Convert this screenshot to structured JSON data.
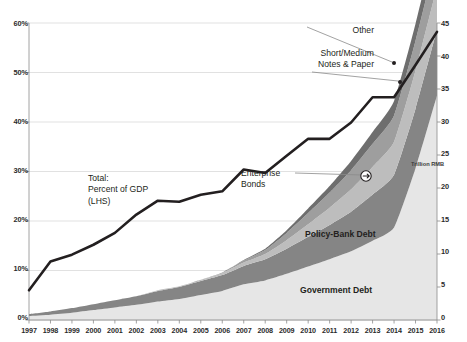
{
  "chart_data": {
    "type": "area",
    "title": "",
    "subtitle": "",
    "xlabel": "",
    "ylabel": "",
    "ylabel_right": "Trillion RMB",
    "grid": true,
    "legend_position": "in-plot annotations",
    "x": [
      1997,
      1998,
      1999,
      2000,
      2001,
      2002,
      2003,
      2004,
      2005,
      2006,
      2007,
      2008,
      2009,
      2010,
      2011,
      2012,
      2013,
      2014,
      2015,
      2016
    ],
    "xtick_labels": [
      "1997",
      "1998",
      "1999",
      "2000",
      "2001",
      "2002",
      "2003",
      "2004",
      "2005",
      "2006",
      "2007",
      "2008",
      "2009",
      "2010",
      "2011",
      "2012",
      "2013",
      "2014",
      "2015",
      "2016"
    ],
    "left_axis": {
      "ticks": [
        0,
        10,
        20,
        30,
        40,
        50,
        60
      ],
      "tick_labels": [
        "0%",
        "10%",
        "20%",
        "30%",
        "40%",
        "50%",
        "60%"
      ],
      "ylim": [
        0,
        60
      ],
      "unit": "percent of GDP"
    },
    "right_axis": {
      "ticks": [
        0,
        5,
        10,
        15,
        20,
        25,
        30,
        35,
        40,
        45
      ],
      "tick_labels": [
        "0",
        "5",
        "10",
        "15",
        "20",
        "25",
        "30",
        "35",
        "40",
        "45"
      ],
      "ylim": [
        0,
        45
      ],
      "unit": "Trillion RMB"
    },
    "line_series": {
      "name": "Total: Percent of GDP (LHS)",
      "axis": "left",
      "color": "#231f20",
      "values": [
        6.0,
        11.8,
        13.2,
        15.2,
        17.6,
        21.3,
        24.1,
        23.9,
        25.3,
        26.0,
        30.4,
        29.7,
        33.2,
        36.6,
        36.6,
        39.9,
        45.0,
        45.0,
        51.5,
        58.2
      ]
    },
    "stacked_series": [
      {
        "name": "Government Debt",
        "axis": "right",
        "color": "#e6e6e6",
        "values": [
          0.6,
          0.8,
          1.1,
          1.5,
          1.9,
          2.3,
          2.8,
          3.2,
          3.8,
          4.4,
          5.4,
          6.0,
          7.0,
          8.1,
          9.2,
          10.4,
          12.0,
          14.0,
          23.0,
          34.0
        ]
      },
      {
        "name": "Policy-Bank Debt",
        "axis": "right",
        "color": "#858585",
        "values": [
          0.3,
          0.5,
          0.7,
          0.9,
          1.1,
          1.3,
          1.6,
          1.8,
          2.1,
          2.4,
          2.8,
          3.2,
          3.8,
          4.5,
          5.2,
          6.0,
          7.0,
          8.0,
          9.0,
          10.0
        ]
      },
      {
        "name": "Enterprise Bonds",
        "axis": "right",
        "color": "#bdbdbd",
        "values": [
          0.0,
          0.0,
          0.0,
          0.0,
          0.0,
          0.0,
          0.1,
          0.1,
          0.2,
          0.3,
          0.5,
          0.8,
          1.3,
          1.9,
          2.6,
          3.4,
          4.2,
          5.0,
          5.8,
          6.5
        ]
      },
      {
        "name": "Short/Medium Notes & Paper",
        "axis": "right",
        "color": "#9e9e9e",
        "values": [
          0.0,
          0.0,
          0.0,
          0.0,
          0.0,
          0.0,
          0.0,
          0.0,
          0.0,
          0.1,
          0.3,
          0.6,
          1.1,
          1.7,
          2.3,
          2.9,
          3.5,
          4.0,
          4.5,
          5.0
        ]
      },
      {
        "name": "Other",
        "axis": "right",
        "color": "#6e6e6e",
        "values": [
          0.0,
          0.0,
          0.0,
          0.0,
          0.0,
          0.0,
          0.0,
          0.0,
          0.0,
          0.0,
          0.1,
          0.2,
          0.4,
          0.7,
          1.0,
          1.4,
          1.8,
          2.2,
          2.6,
          3.0
        ]
      }
    ],
    "annotations": [
      {
        "id": "total-label",
        "text_lines": [
          "Total:",
          "Percent of GDP",
          "(LHS)"
        ]
      },
      {
        "id": "other-label",
        "text_lines": [
          "Other"
        ]
      },
      {
        "id": "short-medium-label",
        "text_lines": [
          "Short/Medium",
          "Notes & Paper"
        ]
      },
      {
        "id": "enterprise-bonds-label",
        "text_lines": [
          "Enterprise",
          "Bonds"
        ]
      },
      {
        "id": "policy-bank-label",
        "text_lines": [
          "Policy-Bank Debt"
        ]
      },
      {
        "id": "government-debt-label",
        "text_lines": [
          "Government Debt"
        ]
      }
    ]
  },
  "annotations": {
    "total_line1": "Total:",
    "total_line2": "Percent of GDP",
    "total_line3": "(LHS)",
    "other": "Other",
    "short_medium_line1": "Short/Medium",
    "short_medium_line2": "Notes & Paper",
    "enterprise_line1": "Enterprise",
    "enterprise_line2": "Bonds",
    "policy_bank": "Policy-Bank Debt",
    "government_debt": "Government Debt",
    "right_axis_unit": "Trillion RMB"
  },
  "colors": {
    "line": "#231f20",
    "government_debt": "#e6e6e6",
    "policy_bank_debt": "#858585",
    "enterprise_bonds": "#bdbdbd",
    "short_medium": "#9e9e9e",
    "other": "#6e6e6e",
    "grid": "#d4d4d4",
    "axis": "#8c8c8c"
  }
}
